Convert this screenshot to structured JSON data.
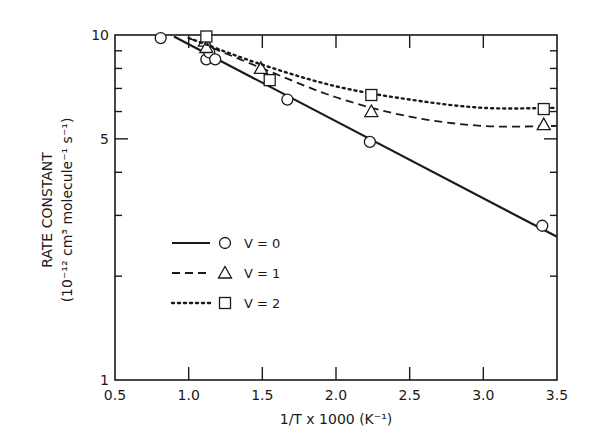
{
  "chart_data": {
    "type": "line",
    "title": "",
    "xlabel": "1/T x 1000 (K⁻¹)",
    "ylabel_line1": "RATE  CONSTANT",
    "ylabel_line2": "(10⁻¹² cm³ molecule⁻¹ s⁻¹)",
    "xlim": [
      0.5,
      3.5
    ],
    "ylim": [
      1,
      10
    ],
    "yscale": "log",
    "x_ticks": [
      "0.5",
      "1.0",
      "1.5",
      "2.0",
      "2.5",
      "3.0",
      "3.5"
    ],
    "y_ticks": [
      "1",
      "5",
      "10"
    ],
    "grid": false,
    "legend_position": "center-left",
    "series": [
      {
        "name": "V = 0",
        "line_style": "solid",
        "marker": "circle",
        "points": [
          [
            0.81,
            9.8
          ],
          [
            1.12,
            8.5
          ],
          [
            1.14,
            8.9
          ],
          [
            1.18,
            8.5
          ],
          [
            1.67,
            6.5
          ],
          [
            2.23,
            4.9
          ],
          [
            3.4,
            2.8
          ]
        ],
        "fit": [
          [
            0.9,
            9.9
          ],
          [
            3.5,
            2.6
          ]
        ]
      },
      {
        "name": "V = 1",
        "line_style": "dashed",
        "marker": "triangle",
        "points": [
          [
            1.11,
            9.6
          ],
          [
            1.12,
            9.2
          ],
          [
            1.49,
            8.0
          ],
          [
            2.24,
            6.0
          ],
          [
            3.41,
            5.5
          ]
        ],
        "fit": [
          [
            1.0,
            9.8
          ],
          [
            1.5,
            8.0
          ],
          [
            2.0,
            6.6
          ],
          [
            2.5,
            5.8
          ],
          [
            3.0,
            5.45
          ],
          [
            3.5,
            5.45
          ]
        ]
      },
      {
        "name": "V = 2",
        "line_style": "dotted",
        "marker": "square",
        "points": [
          [
            1.12,
            9.9
          ],
          [
            1.55,
            7.4
          ],
          [
            2.24,
            6.7
          ],
          [
            3.41,
            6.1
          ]
        ],
        "fit": [
          [
            1.0,
            9.8
          ],
          [
            1.5,
            8.2
          ],
          [
            2.0,
            7.1
          ],
          [
            2.5,
            6.5
          ],
          [
            3.0,
            6.15
          ],
          [
            3.5,
            6.15
          ]
        ]
      }
    ]
  }
}
